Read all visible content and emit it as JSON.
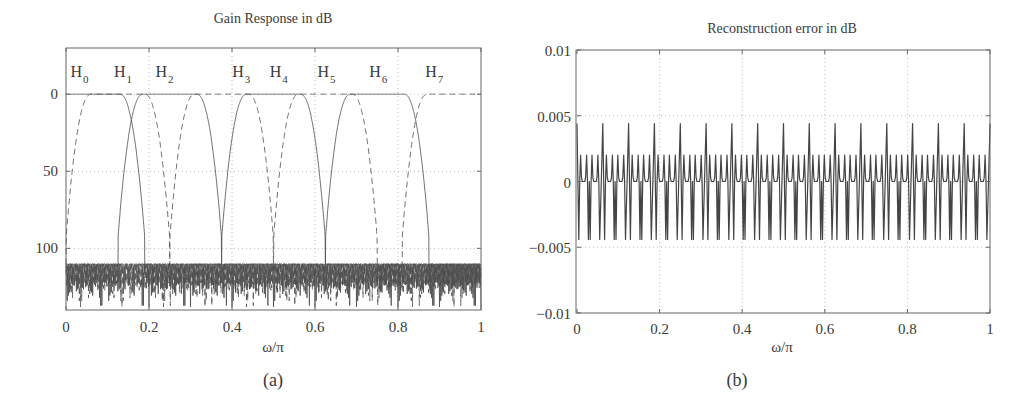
{
  "chart_data": [
    {
      "id": "a",
      "type": "line",
      "title": "Gain Response in dB",
      "xlabel": "ω/π",
      "ylabel": "",
      "caption": "(a)",
      "xlim": [
        0,
        1
      ],
      "ylim": [
        -30,
        140
      ],
      "y_inverted": true,
      "xticks": [
        "0",
        "0.2",
        "0.4",
        "0.6",
        "0.8",
        "1"
      ],
      "xtick_values": [
        0,
        0.2,
        0.4,
        0.6,
        0.8,
        1
      ],
      "yticks": [
        "0",
        "50",
        "100"
      ],
      "ytick_values": [
        0,
        50,
        100
      ],
      "grid": true,
      "legend": "inline labels",
      "band_labels": [
        {
          "text": "H",
          "sub": "0",
          "x": 0.03
        },
        {
          "text": "H",
          "sub": "1",
          "x": 0.135
        },
        {
          "text": "H",
          "sub": "2",
          "x": 0.235
        },
        {
          "text": "H",
          "sub": "3",
          "x": 0.42
        },
        {
          "text": "H",
          "sub": "4",
          "x": 0.51
        },
        {
          "text": "H",
          "sub": "5",
          "x": 0.625
        },
        {
          "text": "H",
          "sub": "6",
          "x": 0.75
        },
        {
          "text": "H",
          "sub": "7",
          "x": 0.885
        }
      ],
      "series": [
        {
          "name": "H0",
          "style": "solid",
          "passband": [
            0,
            0.0625
          ],
          "stopband_attenuation_db": 112
        },
        {
          "name": "H1",
          "style": "dashed",
          "passband": [
            0.0625,
            0.1875
          ],
          "stopband_attenuation_db": 112
        },
        {
          "name": "H2",
          "style": "solid",
          "passband": [
            0.1875,
            0.3125
          ],
          "stopband_attenuation_db": 112
        },
        {
          "name": "H3",
          "style": "dashed",
          "passband": [
            0.3125,
            0.4375
          ],
          "stopband_attenuation_db": 112
        },
        {
          "name": "H4",
          "style": "solid",
          "passband": [
            0.4375,
            0.5625
          ],
          "stopband_attenuation_db": 112
        },
        {
          "name": "H5",
          "style": "dashed",
          "passband": [
            0.5625,
            0.6875
          ],
          "stopband_attenuation_db": 112
        },
        {
          "name": "H6",
          "style": "solid",
          "passband": [
            0.6875,
            0.8125
          ],
          "stopband_attenuation_db": 112
        },
        {
          "name": "H7",
          "style": "dashed",
          "passband": [
            0.8125,
            1.0
          ],
          "stopband_attenuation_db": 112
        }
      ],
      "notes": "Passband gain 0 dB; mainlobe nulls near x=0.06,0.19,0.31,0.44,0.56,0.69,0.81,0.94; stopband ripple floor ~110-140 dB"
    },
    {
      "id": "b",
      "type": "line",
      "title": "Reconstruction error in dB",
      "xlabel": "ω/π",
      "ylabel": "",
      "caption": "(b)",
      "xlim": [
        0,
        1
      ],
      "ylim": [
        -0.01,
        0.01
      ],
      "xticks": [
        "0",
        "0.2",
        "0.4",
        "0.6",
        "0.8",
        "1"
      ],
      "xtick_values": [
        0,
        0.2,
        0.4,
        0.6,
        0.8,
        1
      ],
      "yticks": [
        "0.01",
        "0.005",
        "0",
        "-0.005",
        "-0.01"
      ],
      "ytick_values": [
        0.01,
        0.005,
        0,
        -0.005,
        -0.01
      ],
      "grid": true,
      "series": [
        {
          "name": "error",
          "style": "solid",
          "periods": 16,
          "peak_max": 0.0044,
          "peak_min": -0.0044,
          "secondary_bump": 0.002,
          "baseline": 0
        }
      ]
    }
  ]
}
